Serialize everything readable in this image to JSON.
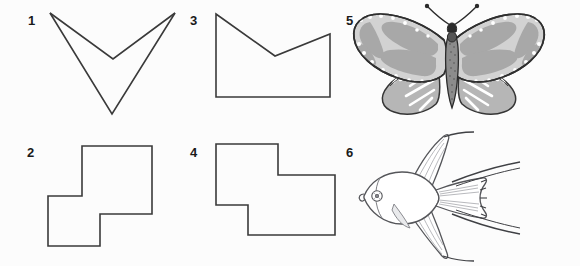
{
  "page": {
    "background_color": "#fcfcfc",
    "width": 580,
    "height": 266,
    "stroke_color": "#3a3a3a",
    "label_color": "#1a1a1a"
  },
  "figures": [
    {
      "id": "figure-1",
      "label": "1",
      "label_x": 28,
      "label_y": 14,
      "kind": "chevron-outline",
      "description": "Open V chevron / arrow outline with two nested V strokes",
      "points": "50,13 111,113 175,13 112,58"
    },
    {
      "id": "figure-2",
      "label": "2",
      "label_x": 27,
      "label_y": 146,
      "kind": "staircase-polygon",
      "description": "Z-shaped staircase polygon made of two offset squares",
      "points": "82,146 152,146 152,214 100,214 100,246 48,246 48,196 82,196"
    },
    {
      "id": "figure-3",
      "label": "3",
      "label_x": 190,
      "label_y": 14,
      "kind": "notched-rectangle",
      "description": "Rectangle with V notch cut into the top edge",
      "points": "216,14 275,56 330,34 330,97 216,97"
    },
    {
      "id": "figure-4",
      "label": "4",
      "label_x": 190,
      "label_y": 146,
      "kind": "staircase-polygon-wide",
      "description": "Wide Z-shaped staircase polygon, two offset rectangles",
      "points": "216,144 278,144 278,175 335,175 335,235 248,235 248,205 216,205"
    },
    {
      "id": "figure-5",
      "label": "5",
      "label_x": 346,
      "label_y": 14,
      "kind": "butterfly-illustration",
      "description": "Monarch-style butterfly with spread wings, gray wing cells, white veins and marginal spots, stippled body and clubbed antennae"
    },
    {
      "id": "figure-6",
      "label": "6",
      "label_x": 346,
      "label_y": 146,
      "kind": "angelfish-illustration",
      "description": "Angelfish line drawing facing left with tall dorsal and anal fins, forked tail and trailing filaments"
    }
  ],
  "colors": {
    "outline": "#3a3a3a",
    "butterfly_wing_fill": "#a8a8a8",
    "butterfly_wing_fill_light": "#bfbfbf",
    "butterfly_body": "#6e6e6e",
    "fish_line": "#55565a",
    "fish_shade": "#d9dade"
  }
}
